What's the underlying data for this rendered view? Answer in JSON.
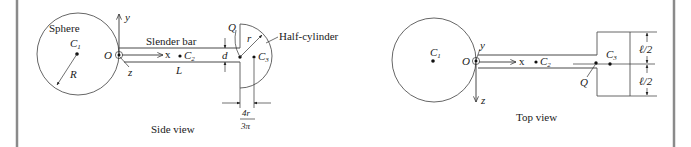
{
  "figure": {
    "side_view": {
      "caption": "Side view",
      "labels": {
        "sphere": "Sphere",
        "c1": "C",
        "c1_sub": "1",
        "radius": "R",
        "origin": "O",
        "y_axis": "y",
        "z_axis": "z",
        "x_axis": "x",
        "slender_bar": "Slender bar",
        "c2": "C",
        "c2_sub": "2",
        "length": "L",
        "thickness": "d",
        "q_point": "Q",
        "small_radius": "r",
        "half_cylinder": "Half-cylinder",
        "c3": "C",
        "c3_sub": "3",
        "offset_numerator": "4r",
        "offset_denominator": "3π"
      }
    },
    "top_view": {
      "caption": "Top view",
      "labels": {
        "c1": "C",
        "c1_sub": "1",
        "origin": "O",
        "y_axis": "y",
        "z_axis": "z",
        "x_axis": "x",
        "c2": "C",
        "c2_sub": "2",
        "c3": "C",
        "c3_sub": "3",
        "q_point": "Q",
        "half_width_top": "ℓ/2",
        "half_width_bottom": "ℓ/2"
      }
    }
  }
}
